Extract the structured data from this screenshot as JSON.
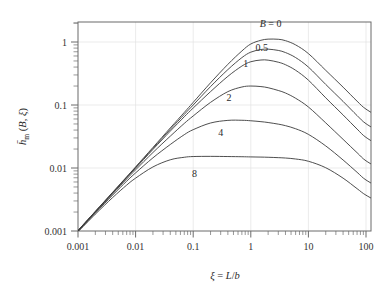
{
  "chart_data": {
    "type": "line",
    "title": "",
    "subtitle": "",
    "xlabel": "ξ = L/b",
    "ylabel": "h̄ₘ (B, ξ)",
    "xscale": "log",
    "yscale": "log",
    "xlim": [
      0.001,
      200
    ],
    "ylim": [
      0.001,
      2
    ],
    "grid": true,
    "grid_color": "#e2e2e2",
    "legend_position": "inline-curve-labels",
    "line_color": "#3a3a3a",
    "frame_color": "#6b6b6b",
    "background": "#ffffff",
    "xticks": [
      0.001,
      0.01,
      0.1,
      1,
      10,
      100
    ],
    "xtick_labels": [
      "0.001",
      "0.01",
      "0.1",
      "1",
      "10",
      "100"
    ],
    "yticks": [
      0.001,
      0.01,
      0.1,
      1
    ],
    "ytick_labels": [
      "0.001",
      "0.01",
      "0.1",
      "1"
    ],
    "annotations": [
      {
        "text": "B = 0",
        "x": 2.2,
        "y": 1.75,
        "name": "curve-label-b-0"
      },
      {
        "text": "0.5",
        "x": 1.55,
        "y": 0.72,
        "name": "curve-label-b-0-5"
      },
      {
        "text": "1",
        "x": 0.82,
        "y": 0.4,
        "name": "curve-label-b-1"
      },
      {
        "text": "2",
        "x": 0.42,
        "y": 0.115,
        "name": "curve-label-b-2"
      },
      {
        "text": "4",
        "x": 0.3,
        "y": 0.032,
        "name": "curve-label-b-4"
      },
      {
        "text": "8",
        "x": 0.105,
        "y": 0.0072,
        "name": "curve-label-b-8"
      }
    ],
    "series": [
      {
        "name": "B = 0",
        "label": "B = 0",
        "x": [
          0.001,
          0.002,
          0.004,
          0.007,
          0.01,
          0.02,
          0.04,
          0.07,
          0.1,
          0.2,
          0.4,
          0.7,
          1.0,
          1.5,
          2.0,
          3.0,
          4.0,
          6.0,
          10.0,
          20.0,
          40.0,
          70.0,
          100.0,
          200.0
        ],
        "y": [
          0.00102,
          0.00205,
          0.00412,
          0.00725,
          0.0104,
          0.0212,
          0.0432,
          0.0762,
          0.11,
          0.225,
          0.442,
          0.72,
          0.93,
          1.065,
          1.11,
          1.105,
          1.05,
          0.9,
          0.655,
          0.355,
          0.192,
          0.115,
          0.086,
          0.059
        ]
      },
      {
        "name": "B = 0.5",
        "label": "0.5",
        "x": [
          0.001,
          0.002,
          0.004,
          0.007,
          0.01,
          0.02,
          0.04,
          0.07,
          0.1,
          0.2,
          0.4,
          0.7,
          1.0,
          1.5,
          2.0,
          3.0,
          4.0,
          6.0,
          10.0,
          20.0,
          40.0,
          70.0,
          100.0,
          200.0
        ],
        "y": [
          0.00102,
          0.00204,
          0.00408,
          0.00714,
          0.0102,
          0.0205,
          0.041,
          0.071,
          0.1,
          0.196,
          0.365,
          0.565,
          0.69,
          0.76,
          0.77,
          0.735,
          0.68,
          0.566,
          0.4,
          0.212,
          0.114,
          0.068,
          0.0505,
          0.0345
        ]
      },
      {
        "name": "B = 1",
        "label": "1",
        "x": [
          0.001,
          0.002,
          0.004,
          0.007,
          0.01,
          0.02,
          0.04,
          0.07,
          0.1,
          0.2,
          0.4,
          0.7,
          1.0,
          1.5,
          2.0,
          3.0,
          4.0,
          6.0,
          10.0,
          20.0,
          40.0,
          70.0,
          100.0,
          200.0
        ],
        "y": [
          0.00101,
          0.00202,
          0.00402,
          0.007,
          0.00995,
          0.0197,
          0.0385,
          0.065,
          0.0895,
          0.163,
          0.285,
          0.415,
          0.486,
          0.518,
          0.515,
          0.478,
          0.436,
          0.356,
          0.248,
          0.13,
          0.0695,
          0.0415,
          0.0306,
          0.0208
        ]
      },
      {
        "name": "B = 2",
        "label": "2",
        "x": [
          0.001,
          0.002,
          0.004,
          0.007,
          0.01,
          0.02,
          0.04,
          0.07,
          0.1,
          0.2,
          0.4,
          0.7,
          1.0,
          1.5,
          2.0,
          3.0,
          4.0,
          6.0,
          10.0,
          20.0,
          40.0,
          70.0,
          100.0,
          200.0
        ],
        "y": [
          0.001,
          0.00198,
          0.0039,
          0.0067,
          0.00935,
          0.0176,
          0.032,
          0.051,
          0.067,
          0.11,
          0.163,
          0.193,
          0.2,
          0.196,
          0.188,
          0.17,
          0.155,
          0.128,
          0.093,
          0.052,
          0.0285,
          0.0175,
          0.013,
          0.009
        ]
      },
      {
        "name": "B = 4",
        "label": "4",
        "x": [
          0.001,
          0.002,
          0.004,
          0.007,
          0.01,
          0.02,
          0.04,
          0.07,
          0.1,
          0.2,
          0.4,
          0.7,
          1.0,
          1.5,
          2.0,
          3.0,
          4.0,
          6.0,
          10.0,
          20.0,
          40.0,
          70.0,
          100.0,
          200.0
        ],
        "y": [
          0.00099,
          0.00193,
          0.00372,
          0.00618,
          0.00836,
          0.0145,
          0.0236,
          0.0338,
          0.0406,
          0.0518,
          0.057,
          0.0572,
          0.0562,
          0.0544,
          0.0527,
          0.0497,
          0.047,
          0.042,
          0.0342,
          0.0224,
          0.0134,
          0.00855,
          0.00645,
          0.0045
        ]
      },
      {
        "name": "B = 8",
        "label": "8",
        "x": [
          0.001,
          0.002,
          0.004,
          0.007,
          0.01,
          0.02,
          0.04,
          0.07,
          0.1,
          0.2,
          0.4,
          0.7,
          1.0,
          1.5,
          2.0,
          3.0,
          4.0,
          6.0,
          10.0,
          20.0,
          40.0,
          70.0,
          100.0,
          200.0
        ],
        "y": [
          0.00097,
          0.00185,
          0.0034,
          0.00535,
          0.0069,
          0.0104,
          0.0135,
          0.0148,
          0.0152,
          0.0153,
          0.0152,
          0.0151,
          0.015,
          0.0149,
          0.0148,
          0.0146,
          0.0144,
          0.0139,
          0.0128,
          0.0101,
          0.0069,
          0.0047,
          0.0037,
          0.00262
        ]
      }
    ]
  }
}
